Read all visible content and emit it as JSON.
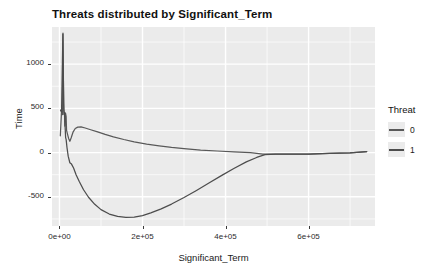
{
  "chart_data": {
    "type": "line",
    "title": "Threats distributed by Significant_Term",
    "xlabel": "Significant_Term",
    "ylabel": "Time",
    "xlim": [
      -18000,
      760000
    ],
    "ylim": [
      -830,
      1420
    ],
    "x_ticks": [
      0,
      200000,
      400000,
      600000
    ],
    "x_tick_labels": [
      "0e+00",
      "2e+05",
      "4e+05",
      "6e+05"
    ],
    "y_ticks": [
      -500,
      0,
      500,
      1000
    ],
    "y_tick_labels": [
      "-500",
      "0",
      "500",
      "1000"
    ],
    "grid": true,
    "panel_background": "#ebebeb",
    "grid_color": "#ffffff",
    "legend": {
      "title": "Threat",
      "position": "right",
      "entries": [
        {
          "label": "0",
          "color": "#595959"
        },
        {
          "label": "1",
          "color": "#4d4d4d"
        }
      ]
    },
    "series": [
      {
        "name": "0",
        "color": "#595959",
        "points": [
          [
            2000,
            190
          ],
          [
            5000,
            470
          ],
          [
            7000,
            430
          ],
          [
            8500,
            1350
          ],
          [
            10000,
            560
          ],
          [
            11000,
            430
          ],
          [
            12000,
            455
          ],
          [
            13000,
            300
          ],
          [
            14500,
            445
          ],
          [
            16000,
            410
          ],
          [
            17000,
            255
          ],
          [
            19000,
            215
          ],
          [
            22000,
            160
          ],
          [
            25000,
            128
          ],
          [
            28000,
            165
          ],
          [
            33000,
            235
          ],
          [
            38000,
            272
          ],
          [
            44000,
            288
          ],
          [
            52000,
            290
          ],
          [
            62000,
            278
          ],
          [
            75000,
            258
          ],
          [
            90000,
            236
          ],
          [
            110000,
            205
          ],
          [
            130000,
            178
          ],
          [
            155000,
            148
          ],
          [
            180000,
            122
          ],
          [
            210000,
            96
          ],
          [
            240000,
            76
          ],
          [
            270000,
            58
          ],
          [
            300000,
            44
          ],
          [
            340000,
            28
          ],
          [
            380000,
            18
          ],
          [
            420000,
            8
          ],
          [
            460000,
            0
          ],
          [
            490000,
            -16
          ],
          [
            520000,
            -18
          ],
          [
            560000,
            -18
          ],
          [
            600000,
            -16
          ],
          [
            650000,
            -10
          ],
          [
            700000,
            -2
          ],
          [
            740000,
            12
          ]
        ]
      },
      {
        "name": "1",
        "color": "#4d4d4d",
        "points": [
          [
            2500,
            480
          ],
          [
            5000,
            460
          ],
          [
            7000,
            1000
          ],
          [
            8200,
            1340
          ],
          [
            9200,
            900
          ],
          [
            10500,
            480
          ],
          [
            11500,
            430
          ],
          [
            12500,
            455
          ],
          [
            13500,
            300
          ],
          [
            14800,
            170
          ],
          [
            16000,
            150
          ],
          [
            18000,
            60
          ],
          [
            21000,
            -40
          ],
          [
            25000,
            -115
          ],
          [
            29000,
            -130
          ],
          [
            34000,
            -175
          ],
          [
            40000,
            -250
          ],
          [
            48000,
            -330
          ],
          [
            58000,
            -420
          ],
          [
            70000,
            -505
          ],
          [
            85000,
            -585
          ],
          [
            100000,
            -645
          ],
          [
            120000,
            -695
          ],
          [
            140000,
            -722
          ],
          [
            160000,
            -732
          ],
          [
            180000,
            -730
          ],
          [
            200000,
            -712
          ],
          [
            220000,
            -682
          ],
          [
            245000,
            -636
          ],
          [
            270000,
            -582
          ],
          [
            300000,
            -508
          ],
          [
            330000,
            -428
          ],
          [
            360000,
            -344
          ],
          [
            390000,
            -260
          ],
          [
            420000,
            -180
          ],
          [
            450000,
            -105
          ],
          [
            475000,
            -55
          ],
          [
            495000,
            -24
          ],
          [
            520000,
            -18
          ],
          [
            560000,
            -18
          ],
          [
            600000,
            -16
          ],
          [
            650000,
            -10
          ],
          [
            700000,
            -2
          ],
          [
            740000,
            12
          ]
        ]
      }
    ]
  }
}
